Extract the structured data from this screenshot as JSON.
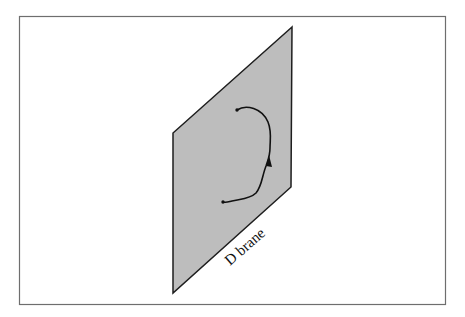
{
  "figure": {
    "label": "D brane",
    "colors": {
      "background": "#ffffff",
      "frame": "#6e6e6e",
      "brane_fill": "#bdbdbd",
      "brane_edge": "#1e1e1e",
      "string": "#111111"
    },
    "elements": [
      {
        "type": "frame",
        "description": "rectangular border"
      },
      {
        "type": "brane",
        "description": "gray parallelogram plane"
      },
      {
        "type": "open-string",
        "description": "curved string with arrow, endpoints on brane"
      }
    ]
  }
}
